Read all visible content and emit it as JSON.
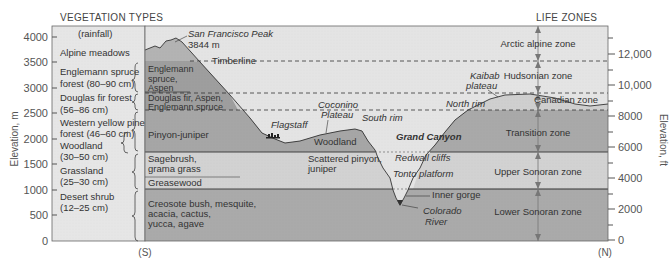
{
  "headers": {
    "left": "VEGETATION TYPES",
    "right": "LIFE ZONES",
    "rainfall": "(rainfall)"
  },
  "axes": {
    "left_label": "Elevation, m",
    "right_label": "Elevation, ft",
    "left_ticks": [
      "4000",
      "3500",
      "3000",
      "2500",
      "2000",
      "1500",
      "1000",
      "500",
      "0"
    ],
    "right_ticks": [
      "12,000",
      "10,000",
      "8000",
      "6000",
      "4000",
      "2000",
      "0"
    ],
    "south": "(S)",
    "north": "(N)"
  },
  "vegetation_types": [
    {
      "line1": "Alpine meadows",
      "line2": ""
    },
    {
      "line1": "Englemann spruce",
      "line2": "forest (80–90 cm)"
    },
    {
      "line1": "Douglas fir forest",
      "line2": "(56–86 cm)"
    },
    {
      "line1": "Western yellow pine",
      "line2": "forest (46–60 cm)"
    },
    {
      "line1": "Woodland",
      "line2": "(30–50 cm)"
    },
    {
      "line1": "Grassland",
      "line2": "(25–30 cm)"
    },
    {
      "line1": "Desert shrub",
      "line2": "(12–25 cm)"
    }
  ],
  "profile_labels": {
    "peak_name": "San Francisco Peak",
    "peak_elev": "3844 m",
    "timberline": "Timberline",
    "englemann_1": "Englemann",
    "englemann_2": "spruce,",
    "englemann_3": "Aspen",
    "douglas_1": "Douglas fir, Aspen,",
    "douglas_2": "Englemann spruce",
    "pinyon": "Pinyon-juniper",
    "flagstaff": "Flagstaff",
    "coconino_1": "Coconino",
    "coconino_2": "Plateau",
    "woodland": "Woodland",
    "south_rim": "South rim",
    "grand_canyon": "Grand Canyon",
    "kaibab_1": "Kaibab",
    "kaibab_2": "plateau",
    "north_rim": "North rim",
    "sagebrush_1": "Sagebrush,",
    "sagebrush_2": "grama grass",
    "greasewood": "Greasewood",
    "scattered_1": "Scattered pinyon,",
    "scattered_2": "juniper",
    "redwall": "Redwall cliffs",
    "tonto": "Tonto platform",
    "inner_gorge": "Inner gorge",
    "colorado_1": "Colorado",
    "colorado_2": "River",
    "creosote_1": "Creosote bush, mesquite,",
    "creosote_2": "acacia, cactus,",
    "creosote_3": "yucca, agave"
  },
  "life_zones": [
    "Arctic alpine zone",
    "Hudsonian zone",
    "Canadian zone",
    "Transition zone",
    "Upper Sonoran zone",
    "Lower Sonoran zone"
  ],
  "colors": {
    "dark_band": "#a9a9a9",
    "mid_band": "#bdbdbd",
    "light_band": "#d4d4d4",
    "sky": "#e3e3e3",
    "left_panel": "#e6e6e6"
  }
}
